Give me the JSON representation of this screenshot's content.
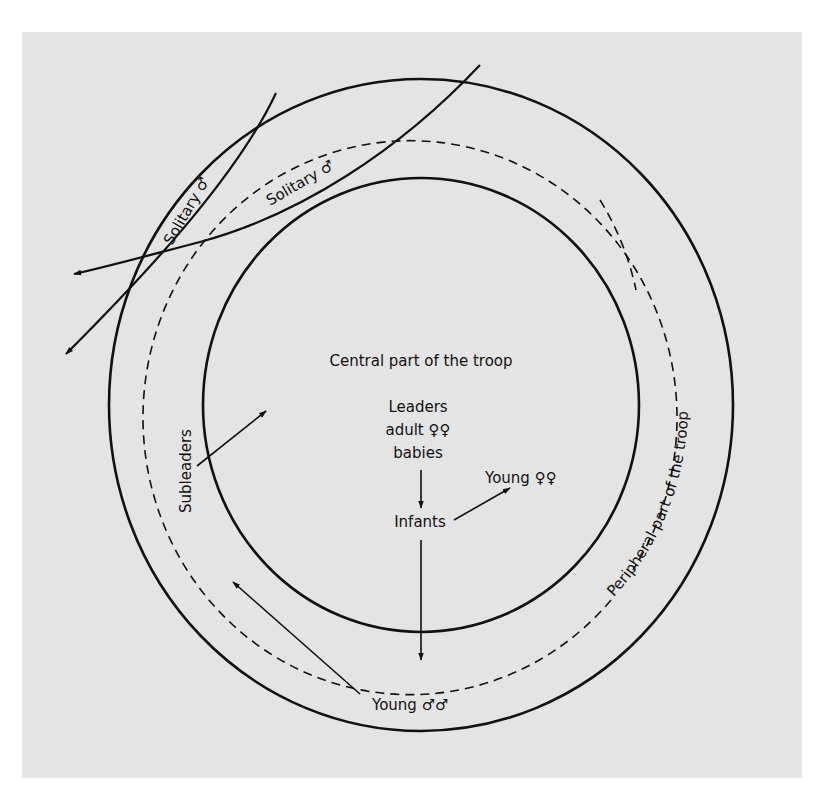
{
  "diagram": {
    "type": "concentric-zones",
    "background_color": "#e4e4e4",
    "line_color": "#111111",
    "zones": {
      "central": {
        "label": "Central part of the troop"
      },
      "peripheral": {
        "label": "Peripheral part of the troop"
      }
    },
    "central_members": {
      "line1": "Leaders",
      "line2": "adult ♀♀",
      "line3": "babies"
    },
    "infants_label": "Infants",
    "young_females_label": "Young ♀♀",
    "young_males_label": "Young ♂♂",
    "subleaders_label": "Subleaders",
    "solitary_labels": [
      "Solitary ♂",
      "Solitary ♂"
    ],
    "flows": [
      {
        "from": "Leaders / adult ♀♀ / babies",
        "to": "Infants"
      },
      {
        "from": "Infants",
        "to": "Young ♀♀"
      },
      {
        "from": "Infants",
        "to": "Peripheral part of the troop"
      },
      {
        "from": "Young ♂♂",
        "to": "Subleaders"
      },
      {
        "from": "Subleaders",
        "to": "Central part of the troop"
      },
      {
        "from": "Solitary ♂",
        "to": "outside the troop"
      },
      {
        "from": "Solitary ♂",
        "to": "outside the troop"
      }
    ]
  }
}
